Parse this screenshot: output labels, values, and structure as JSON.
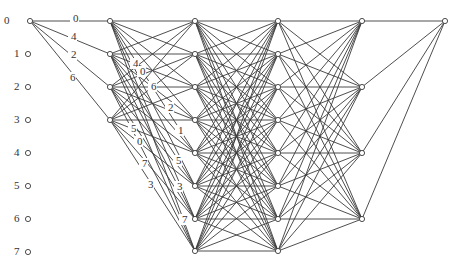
{
  "row_labels": [
    {
      "text": "0",
      "x": 4,
      "y": 24
    },
    {
      "text": "1",
      "x": 14,
      "y": 57
    },
    {
      "text": "2",
      "x": 14,
      "y": 90
    },
    {
      "text": "3",
      "x": 14,
      "y": 123
    },
    {
      "text": "4",
      "x": 14,
      "y": 156
    },
    {
      "text": "5",
      "x": 14,
      "y": 189
    },
    {
      "text": "6",
      "x": 14,
      "y": 222
    },
    {
      "text": "7",
      "x": 14,
      "y": 255
    }
  ],
  "input_nodes": [
    {
      "x": 30,
      "y": 21
    },
    {
      "x": 30,
      "y": 54
    },
    {
      "x": 30,
      "y": 87
    },
    {
      "x": 30,
      "y": 120
    },
    {
      "x": 30,
      "y": 153
    },
    {
      "x": 30,
      "y": 186
    },
    {
      "x": 30,
      "y": 219
    },
    {
      "x": 30,
      "y": 252
    }
  ],
  "columns": [
    {
      "name": "stage-1",
      "x": 110,
      "ys": [
        21,
        54,
        87,
        120
      ]
    },
    {
      "name": "stage-2",
      "x": 195,
      "ys": [
        21,
        54,
        87,
        120,
        153,
        186,
        219,
        251
      ]
    },
    {
      "name": "stage-3",
      "x": 278,
      "ys": [
        21,
        54,
        87,
        120,
        153,
        186,
        219,
        251
      ]
    },
    {
      "name": "stage-4",
      "x": 362,
      "ys": [
        21,
        87,
        153,
        219
      ]
    },
    {
      "name": "output",
      "x": 445,
      "ys": [
        21
      ]
    }
  ],
  "edge_labels": [
    {
      "text": "0",
      "x": 73,
      "y": 22
    },
    {
      "text": "4",
      "x": 71,
      "y": 40
    },
    {
      "text": "2",
      "x": 71,
      "y": 58
    },
    {
      "text": "6",
      "x": 70,
      "y": 81
    },
    {
      "text": "4",
      "x": 133,
      "y": 67
    },
    {
      "text": "0",
      "x": 140,
      "y": 75
    },
    {
      "text": "6",
      "x": 151,
      "y": 90
    },
    {
      "text": "2",
      "x": 168,
      "y": 111
    },
    {
      "text": "1",
      "x": 178,
      "y": 134
    },
    {
      "text": "5",
      "x": 131,
      "y": 132
    },
    {
      "text": "0",
      "x": 137,
      "y": 145
    },
    {
      "text": "5",
      "x": 176,
      "y": 164
    },
    {
      "text": "7",
      "x": 142,
      "y": 167
    },
    {
      "text": "3",
      "x": 177,
      "y": 190
    },
    {
      "text": "3",
      "x": 148,
      "y": 188
    },
    {
      "text": "7",
      "x": 182,
      "y": 223
    }
  ]
}
